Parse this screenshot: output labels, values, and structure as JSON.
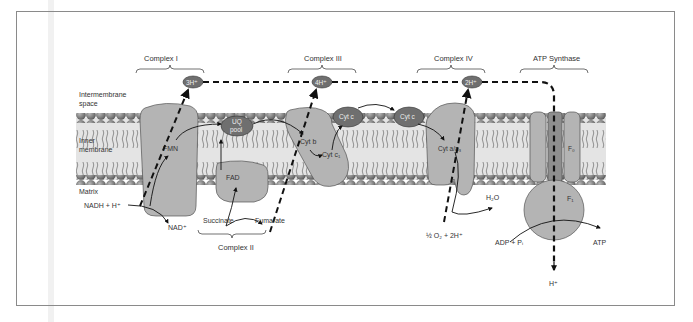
{
  "diagram": {
    "regions": {
      "intermembrane": "Intermembrane",
      "intermembrane2": "space",
      "inner": "Inner",
      "inner2": "membrane",
      "matrix": "Matrix"
    },
    "complexes": [
      {
        "id": "complex-i",
        "label": "Complex I",
        "cofactor": "FMN",
        "protons": "3H⁺"
      },
      {
        "id": "complex-ii",
        "label": "Complex II",
        "cofactor": "FAD"
      },
      {
        "id": "complex-iii",
        "label": "Complex III",
        "cofactors": [
          "Cyt b",
          "Cyt c₁"
        ],
        "protons": "4H⁺"
      },
      {
        "id": "complex-iv",
        "label": "Complex IV",
        "cofactor": "Cyt a/a₃",
        "protons": "2H⁺"
      },
      {
        "id": "atp-synthase",
        "label": "ATP Synthase",
        "subunits": [
          "F₀",
          "F₁"
        ]
      }
    ],
    "carriers": {
      "uq_pool_1": "UQ",
      "uq_pool_2": "pool",
      "cyt_c": "Cyt c"
    },
    "substrates": {
      "nadh": "NADH + H⁺",
      "nad": "NAD⁺",
      "succinate": "Succinate",
      "fumarate": "Fumarate",
      "oxygen": "½ O₂ + 2H⁺",
      "water": "H₂O",
      "adp": "ADP + Pᵢ",
      "atp": "ATP",
      "proton_out": "H⁺"
    },
    "colors": {
      "protein": "#b4b4b4",
      "carrier": "#6f6f6f",
      "lipid_head": "#7c7c7c",
      "membrane_band": "#e4e4e4",
      "outline": "#555555"
    }
  }
}
